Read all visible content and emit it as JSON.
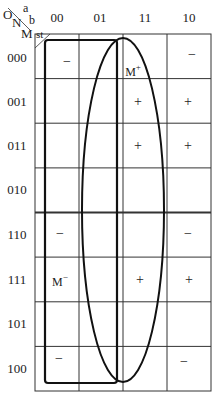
{
  "corner": {
    "o": "O",
    "n": "N",
    "m": "M",
    "a": "a",
    "b": "b",
    "st": "st"
  },
  "columns": [
    "00",
    "01",
    "11",
    "10"
  ],
  "rows": [
    "000",
    "001",
    "011",
    "010",
    "110",
    "111",
    "101",
    "100"
  ],
  "cells": [
    [
      "−",
      "",
      "M+",
      "−"
    ],
    [
      "",
      "",
      "+",
      "+"
    ],
    [
      "",
      "",
      "+",
      "+"
    ],
    [
      "",
      "",
      "",
      ""
    ],
    [
      "−",
      "",
      "",
      "−"
    ],
    [
      "M−",
      "",
      "+",
      "+"
    ],
    [
      "",
      "",
      "",
      ""
    ],
    [
      "−",
      "",
      "",
      "−"
    ]
  ],
  "labels": {
    "m_plus": "M",
    "m_plus_sup": "+",
    "m_minus": "M",
    "m_minus_sup": "−",
    "minus": "−",
    "plus": "+"
  },
  "groups": [
    {
      "name": "rounded-rectangle-loop",
      "columns": [
        "00",
        "01"
      ],
      "rows": "all"
    },
    {
      "name": "ellipse-loop",
      "columns": [
        "01",
        "11"
      ],
      "rows": "all"
    }
  ]
}
